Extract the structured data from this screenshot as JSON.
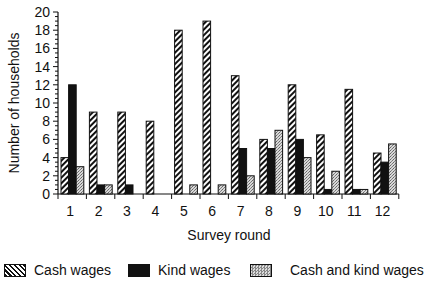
{
  "chart_data": {
    "type": "bar",
    "title": "",
    "xlabel": "Survey round",
    "ylabel": "Number of households",
    "ylim": [
      0,
      20
    ],
    "yticks": [
      0,
      2,
      4,
      6,
      8,
      10,
      12,
      14,
      16,
      18,
      20
    ],
    "grid": false,
    "legend_position": "bottom",
    "categories": [
      "1",
      "2",
      "3",
      "4",
      "5",
      "6",
      "7",
      "8",
      "9",
      "10",
      "11",
      "12"
    ],
    "series": [
      {
        "name": "Cash wages",
        "pattern": "diagonal-hatch",
        "values": [
          4,
          9,
          9,
          8,
          18,
          19,
          13,
          6,
          12,
          6.5,
          11.5,
          4.5
        ]
      },
      {
        "name": "Kind wages",
        "pattern": "solid-black",
        "values": [
          12,
          1,
          1,
          0,
          0,
          0,
          5,
          5,
          6,
          0.5,
          0.5,
          3.5
        ]
      },
      {
        "name": "Cash and kind wages",
        "pattern": "stipple-gray",
        "values": [
          3,
          1,
          0,
          0,
          1,
          1,
          2,
          7,
          4,
          2.5,
          0.5,
          5.5
        ]
      }
    ]
  },
  "legend": {
    "cash": "Cash wages",
    "kind": "Kind wages",
    "both": "Cash and kind wages"
  }
}
